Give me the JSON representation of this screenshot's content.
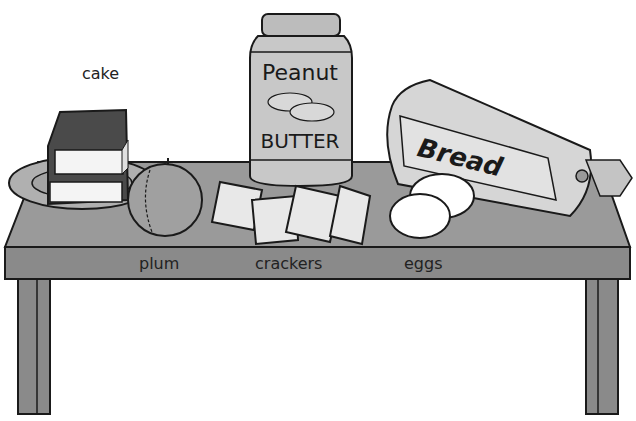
{
  "scene": {
    "description": "Black-and-white illustration of foods on a table",
    "labels": {
      "cake": "cake",
      "plum": "plum",
      "crackers": "crackers",
      "eggs": "eggs"
    },
    "jar_text": {
      "line1": "Peanut",
      "line2": "BUTTER"
    },
    "bread_text": "Bread"
  },
  "colors": {
    "table": "#8a8a8a",
    "table_top": "#9a9a9a",
    "outline": "#1a1a1a",
    "jar": "#c8c8c8",
    "bread": "#d6d6d6",
    "cracker": "#e8e8e8",
    "plum": "#a0a0a0",
    "icing": "#4a4a4a"
  }
}
